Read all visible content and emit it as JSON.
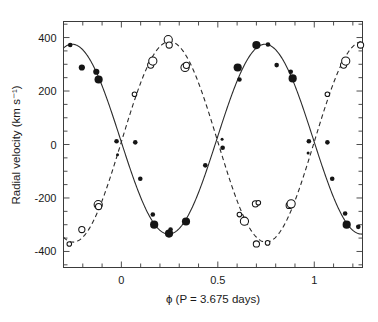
{
  "figure": {
    "background_color": "#ffffff",
    "ink_color": "#1a1a1a"
  },
  "chart_data": {
    "type": "scatter",
    "title": "",
    "subtitle": "",
    "xlabel": "ϕ (P = 3.675 days)",
    "ylabel": "Radial velocity (km s⁻¹)",
    "xlim": [
      -0.3,
      1.25
    ],
    "ylim": [
      -460,
      460
    ],
    "grid": false,
    "legend": "none",
    "xticks": [
      0,
      0.5,
      1
    ],
    "xticklabels": [
      "0",
      "0.5",
      "1"
    ],
    "xtick_minor_step": 0.1,
    "yticks": [
      -400,
      -200,
      0,
      200,
      400
    ],
    "yticklabels": [
      "-400",
      "-200",
      "0",
      "200",
      "400"
    ],
    "ytick_minor_step": 50,
    "annotations": [],
    "series": [
      {
        "name": "primary",
        "marker": "filled-circle",
        "linestyle": "solid",
        "color": "#151515",
        "model": {
          "form": "sinusoid",
          "amplitude": 355,
          "offset": 20,
          "phase_of_maximum": 0.745,
          "period_in_phase": 1.0
        },
        "points": [
          {
            "x": -0.265,
            "y": 372,
            "size": "small"
          },
          {
            "x": -0.205,
            "y": 288,
            "size": "medium"
          },
          {
            "x": -0.13,
            "y": 272,
            "size": "medium"
          },
          {
            "x": -0.118,
            "y": 243,
            "size": "large"
          },
          {
            "x": -0.025,
            "y": 12,
            "size": "small"
          },
          {
            "x": -0.02,
            "y": -38,
            "size": "tiny"
          },
          {
            "x": 0.072,
            "y": 8,
            "size": "small"
          },
          {
            "x": 0.098,
            "y": -128,
            "size": "small"
          },
          {
            "x": 0.163,
            "y": -262,
            "size": "small"
          },
          {
            "x": 0.17,
            "y": -300,
            "size": "large"
          },
          {
            "x": 0.247,
            "y": -333,
            "size": "large"
          },
          {
            "x": 0.255,
            "y": -318,
            "size": "small"
          },
          {
            "x": 0.335,
            "y": -288,
            "size": "large"
          },
          {
            "x": 0.435,
            "y": -78,
            "size": "small"
          },
          {
            "x": 0.522,
            "y": 20,
            "size": "tiny"
          },
          {
            "x": 0.525,
            "y": -12,
            "size": "small"
          },
          {
            "x": 0.603,
            "y": 288,
            "size": "large"
          },
          {
            "x": 0.612,
            "y": 243,
            "size": "small"
          },
          {
            "x": 0.7,
            "y": 372,
            "size": "large"
          },
          {
            "x": 0.76,
            "y": 374,
            "size": "small"
          },
          {
            "x": 0.805,
            "y": 297,
            "size": "small"
          },
          {
            "x": 0.878,
            "y": 272,
            "size": "small"
          },
          {
            "x": 0.888,
            "y": 247,
            "size": "large"
          },
          {
            "x": 0.972,
            "y": 12,
            "size": "small"
          },
          {
            "x": 0.968,
            "y": -32,
            "size": "tiny"
          },
          {
            "x": 1.068,
            "y": 8,
            "size": "small"
          },
          {
            "x": 1.093,
            "y": -128,
            "size": "small"
          },
          {
            "x": 1.16,
            "y": -258,
            "size": "small"
          },
          {
            "x": 1.168,
            "y": -300,
            "size": "large"
          },
          {
            "x": 1.228,
            "y": -308,
            "size": "small"
          }
        ]
      },
      {
        "name": "secondary",
        "marker": "open-circle",
        "linestyle": "dashed",
        "color": "#151515",
        "model": {
          "form": "sinusoid",
          "amplitude": 375,
          "offset": 10,
          "phase_of_maximum": 0.25,
          "period_in_phase": 1.0
        },
        "points": [
          {
            "x": -0.27,
            "y": -372,
            "size": "small"
          },
          {
            "x": -0.205,
            "y": -318,
            "size": "medium"
          },
          {
            "x": -0.12,
            "y": -225,
            "size": "large"
          },
          {
            "x": -0.118,
            "y": -232,
            "size": "medium"
          },
          {
            "x": 0.068,
            "y": 188,
            "size": "small"
          },
          {
            "x": 0.152,
            "y": 297,
            "size": "medium"
          },
          {
            "x": 0.163,
            "y": 312,
            "size": "large"
          },
          {
            "x": 0.243,
            "y": 392,
            "size": "large"
          },
          {
            "x": 0.248,
            "y": 372,
            "size": "medium"
          },
          {
            "x": 0.33,
            "y": 288,
            "size": "large"
          },
          {
            "x": 0.337,
            "y": 296,
            "size": "medium"
          },
          {
            "x": 0.612,
            "y": -262,
            "size": "small"
          },
          {
            "x": 0.638,
            "y": -287,
            "size": "large"
          },
          {
            "x": 0.695,
            "y": -222,
            "size": "medium"
          },
          {
            "x": 0.7,
            "y": -372,
            "size": "medium"
          },
          {
            "x": 0.71,
            "y": -218,
            "size": "small"
          },
          {
            "x": 0.758,
            "y": -368,
            "size": "small"
          },
          {
            "x": 0.87,
            "y": -228,
            "size": "medium"
          },
          {
            "x": 0.88,
            "y": -222,
            "size": "large"
          },
          {
            "x": 1.068,
            "y": 188,
            "size": "small"
          },
          {
            "x": 1.152,
            "y": 297,
            "size": "medium"
          },
          {
            "x": 1.163,
            "y": 312,
            "size": "large"
          },
          {
            "x": 1.24,
            "y": 372,
            "size": "medium"
          }
        ]
      }
    ]
  }
}
